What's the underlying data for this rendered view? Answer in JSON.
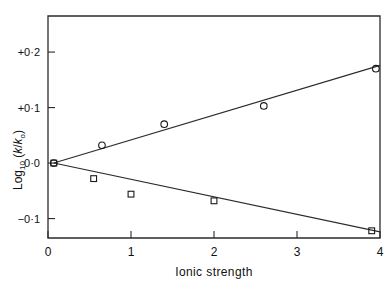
{
  "chart_data": {
    "type": "scatter",
    "title": "",
    "xlabel": "Ionic strength",
    "ylabel": "Log10 (k/ko)",
    "xlim": [
      0,
      4
    ],
    "ylim": [
      -0.135,
      0.265
    ],
    "grid": false,
    "legend": "none",
    "xticks": [
      0,
      1,
      2,
      3,
      4
    ],
    "xtick_labels": [
      "0",
      "1",
      "2",
      "3",
      "4"
    ],
    "yticks": [
      0.2,
      0.1,
      0.0,
      -0.1
    ],
    "ytick_labels": [
      "+0·2",
      "+0·1",
      "0·0",
      "−0·1"
    ],
    "series": [
      {
        "name": "circle-series",
        "marker": "circle",
        "x": [
          0.07,
          0.65,
          1.4,
          2.6,
          3.95
        ],
        "y": [
          0.0,
          0.032,
          0.07,
          0.103,
          0.17
        ],
        "fit_line": {
          "x": [
            0.07,
            4.08
          ],
          "y": [
            0.0,
            0.176
          ]
        }
      },
      {
        "name": "square-series",
        "marker": "square",
        "x": [
          0.07,
          0.55,
          1.0,
          2.0,
          3.9
        ],
        "y": [
          0.0,
          -0.028,
          -0.056,
          -0.068,
          -0.122
        ],
        "fit_line": {
          "x": [
            0.07,
            4.0
          ],
          "y": [
            0.0,
            -0.124
          ]
        }
      }
    ]
  },
  "axis": {
    "x_label": "Ionic strength",
    "y_label_main": "Log",
    "y_label_sub": "10",
    "y_label_paren_open": " (",
    "y_label_k": "k",
    "y_label_slash": "/",
    "y_label_k0": "k",
    "y_label_k0sub": "o",
    "y_label_paren_close": ")",
    "xtick_0": "0",
    "xtick_1": "1",
    "xtick_2": "2",
    "xtick_3": "3",
    "xtick_4": "4",
    "ytick_p02": "·0·2",
    "ytick_p01": "·0·1",
    "ytick_00": "0·0",
    "ytick_m01": "−0·1",
    "ytick_p02_sign": "+",
    "ytick_p01_sign": "+"
  },
  "colors": {
    "axis": "#2b2b2b",
    "marker": "#1a1a1a",
    "background": "#ffffff"
  }
}
